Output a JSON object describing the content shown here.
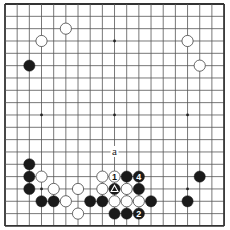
{
  "board": {
    "size": 19,
    "origin_x": 5,
    "origin_y": 4,
    "spacing_x": 12.17,
    "spacing_y": 12.33,
    "line_color": "#555555",
    "edge_color": "#333333",
    "stone_radius": 5.6,
    "black_color": "#1a1a1a",
    "white_fill": "#ffffff",
    "white_stroke": "#444444",
    "hoshi": [
      [
        3,
        3
      ],
      [
        9,
        3
      ],
      [
        15,
        3
      ],
      [
        3,
        9
      ],
      [
        9,
        9
      ],
      [
        15,
        9
      ],
      [
        3,
        15
      ],
      [
        9,
        15
      ],
      [
        15,
        15
      ]
    ]
  },
  "stones": [
    {
      "color": "white",
      "col": 5,
      "row": 2
    },
    {
      "color": "white",
      "col": 3,
      "row": 3
    },
    {
      "color": "black",
      "col": 2,
      "row": 5
    },
    {
      "color": "white",
      "col": 15,
      "row": 3
    },
    {
      "color": "white",
      "col": 16,
      "row": 5
    },
    {
      "color": "black",
      "col": 2,
      "row": 13
    },
    {
      "color": "black",
      "col": 2,
      "row": 14
    },
    {
      "color": "black",
      "col": 2,
      "row": 15
    },
    {
      "color": "white",
      "col": 3,
      "row": 14
    },
    {
      "color": "white",
      "col": 4,
      "row": 15
    },
    {
      "color": "black",
      "col": 3,
      "row": 16
    },
    {
      "color": "black",
      "col": 4,
      "row": 16
    },
    {
      "color": "white",
      "col": 5,
      "row": 16
    },
    {
      "color": "white",
      "col": 6,
      "row": 15
    },
    {
      "color": "white",
      "col": 6,
      "row": 17
    },
    {
      "color": "black",
      "col": 7,
      "row": 16
    },
    {
      "color": "black",
      "col": 8,
      "row": 16
    },
    {
      "color": "white",
      "col": 8,
      "row": 14
    },
    {
      "color": "white",
      "col": 8,
      "row": 15
    },
    {
      "color": "white",
      "col": 9,
      "row": 14,
      "label": "1"
    },
    {
      "color": "black",
      "col": 10,
      "row": 14
    },
    {
      "color": "black",
      "col": 11,
      "row": 14,
      "label": "4"
    },
    {
      "color": "black",
      "col": 9,
      "row": 15,
      "mark": "triangle"
    },
    {
      "color": "white",
      "col": 10,
      "row": 15
    },
    {
      "color": "black",
      "col": 11,
      "row": 15
    },
    {
      "color": "white",
      "col": 9,
      "row": 16
    },
    {
      "color": "white",
      "col": 10,
      "row": 16
    },
    {
      "color": "white",
      "col": 11,
      "row": 16
    },
    {
      "color": "black",
      "col": 12,
      "row": 16
    },
    {
      "color": "black",
      "col": 9,
      "row": 17
    },
    {
      "color": "black",
      "col": 10,
      "row": 17
    },
    {
      "color": "black",
      "col": 11,
      "row": 17,
      "label": "2"
    },
    {
      "color": "black",
      "col": 16,
      "row": 14
    },
    {
      "color": "black",
      "col": 15,
      "row": 16
    }
  ],
  "annotations": [
    {
      "text": "a",
      "col": 9,
      "row": 12
    }
  ]
}
